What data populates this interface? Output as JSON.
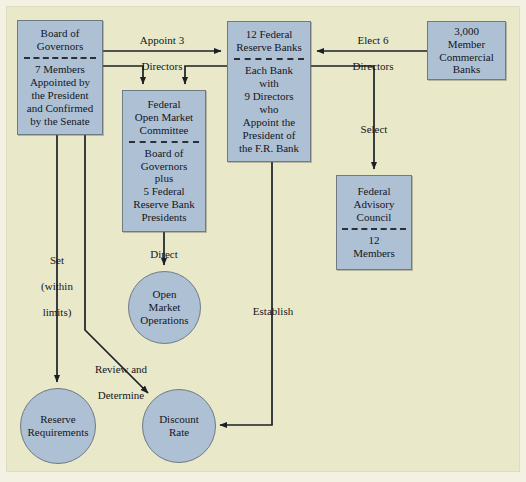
{
  "diagram": {
    "background_color": "#e9e8c9",
    "node_fill_color": "#aec0d4",
    "node_border_color": "#6f7a85",
    "nodes": [
      {
        "id": "board-of-governors",
        "shape": "box",
        "title_lines": [
          "Board of",
          "Governors"
        ],
        "body_lines": [
          "7 Members",
          "Appointed by",
          "the President",
          "and Confirmed",
          "by the Senate"
        ],
        "divider": true
      },
      {
        "id": "fomc",
        "shape": "box",
        "title_lines": [
          "Federal",
          "Open Market",
          "Committee"
        ],
        "body_lines": [
          "Board of",
          "Governors",
          "plus",
          "5 Federal",
          "Reserve Bank",
          "Presidents"
        ],
        "divider": true
      },
      {
        "id": "federal-reserve-banks",
        "shape": "box",
        "title_lines": [
          "12 Federal",
          "Reserve Banks"
        ],
        "body_lines": [
          "Each Bank",
          "with",
          "9 Directors",
          "who",
          "Appoint the",
          "President of",
          "the F.R. Bank"
        ],
        "divider": true
      },
      {
        "id": "member-commercial-banks",
        "shape": "box",
        "title_lines": [
          "3,000",
          "Member",
          "Commercial",
          "Banks"
        ],
        "body_lines": [],
        "divider": false
      },
      {
        "id": "federal-advisory-council",
        "shape": "box",
        "title_lines": [
          "Federal",
          "Advisory",
          "Council"
        ],
        "body_lines": [
          "12",
          "Members"
        ],
        "divider": true
      },
      {
        "id": "open-market-operations",
        "shape": "circle",
        "title_lines": [
          "Open",
          "Market",
          "Operations"
        ],
        "body_lines": [],
        "divider": false
      },
      {
        "id": "reserve-requirements",
        "shape": "circle",
        "title_lines": [
          "Reserve",
          "Requirements"
        ],
        "body_lines": [],
        "divider": false
      },
      {
        "id": "discount-rate",
        "shape": "circle",
        "title_lines": [
          "Discount",
          "Rate"
        ],
        "body_lines": [],
        "divider": false
      }
    ],
    "edges": [
      {
        "id": "appoint-3-directors",
        "label_lines": [
          "Appoint 3",
          "Directors"
        ],
        "from": "board-of-governors",
        "to": "federal-reserve-banks"
      },
      {
        "id": "elect-6-directors",
        "label_lines": [
          "Elect 6",
          "Directors"
        ],
        "from": "member-commercial-banks",
        "to": "federal-reserve-banks"
      },
      {
        "id": "select",
        "label_lines": [
          "Select"
        ],
        "from": "federal-reserve-banks",
        "to": "federal-advisory-council"
      },
      {
        "id": "direct",
        "label_lines": [
          "Direct"
        ],
        "from": "fomc",
        "to": "open-market-operations"
      },
      {
        "id": "set-within-limits",
        "label_lines": [
          "Set",
          "(within",
          "limits)"
        ],
        "from": "board-of-governors",
        "to": "reserve-requirements"
      },
      {
        "id": "review-and-determine",
        "label_lines": [
          "Review and",
          "Determine"
        ],
        "from": "board-of-governors",
        "to": "discount-rate"
      },
      {
        "id": "establish",
        "label_lines": [
          "Establish"
        ],
        "from": "federal-reserve-banks",
        "to": "discount-rate"
      },
      {
        "id": "board-to-fomc",
        "label_lines": [],
        "from": "board-of-governors",
        "to": "fomc"
      },
      {
        "id": "banks-to-fomc",
        "label_lines": [],
        "from": "federal-reserve-banks",
        "to": "fomc"
      }
    ]
  }
}
